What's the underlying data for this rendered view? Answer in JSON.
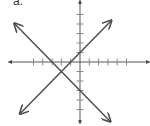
{
  "problem_label": "a.",
  "chart_data": {
    "type": "line",
    "title": "",
    "xlabel": "",
    "ylabel": "",
    "xlim": [
      -7.7,
      7.5
    ],
    "ylim": [
      -6.5,
      6.5
    ],
    "x_ticks": [
      -5,
      -4,
      -3,
      -2,
      -1,
      1,
      2,
      3,
      4,
      5
    ],
    "y_ticks": [
      -5,
      -4,
      -3,
      -2,
      -1,
      1,
      2,
      3,
      4,
      5
    ],
    "tick_labels": false,
    "grid": false,
    "axes_arrows": true,
    "colors": {
      "axes": "#555555",
      "lines": "#4a4a4a"
    },
    "series": [
      {
        "name": "line-1",
        "equation": "y = x + 1",
        "slope": 1,
        "intercept": 1,
        "x": [
          -6.4,
          3.3
        ],
        "y": [
          -5.4,
          4.3
        ],
        "arrows": "both"
      },
      {
        "name": "line-2",
        "equation": "y = -x - 3",
        "slope": -1,
        "intercept": -3,
        "x": [
          -7.0,
          3.2
        ],
        "y": [
          4.0,
          -6.2
        ],
        "arrows": "both"
      }
    ],
    "intersection": {
      "x": -2,
      "y": -1
    }
  }
}
